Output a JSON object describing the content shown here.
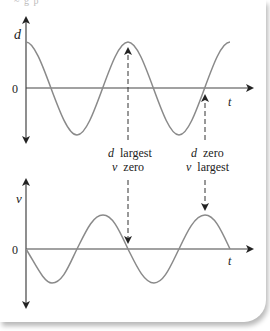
{
  "top_caption": "~ g  p",
  "colors": {
    "curve": "#8a8a8a",
    "axis": "#444444",
    "text": "#222222",
    "dashed": "#333333"
  },
  "top_graph": {
    "y_label": "d",
    "zero_label": "0",
    "x_label": "t",
    "curve": "cosine (displacement)"
  },
  "bottom_graph": {
    "y_label": "v",
    "zero_label": "0",
    "x_label": "t",
    "curve": "negative sine (velocity)"
  },
  "annotations": [
    {
      "line1_var": "d",
      "line1_text": "largest",
      "line2_var": "v",
      "line2_text": "zero"
    },
    {
      "line1_var": "d",
      "line1_text": "zero",
      "line2_var": "v",
      "line2_text": "largest"
    }
  ]
}
